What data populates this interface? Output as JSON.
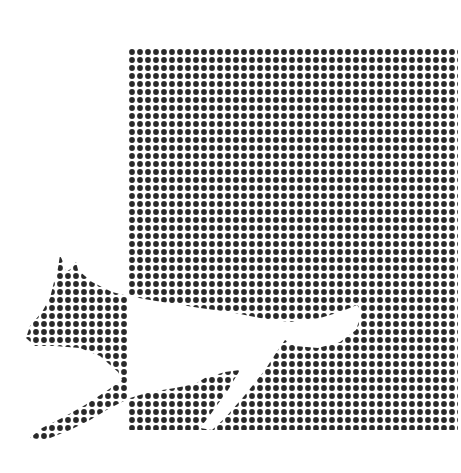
{
  "image": {
    "description": "Halftone illustration: a square field of black dots with a leaping cat silhouette crossing its lower-left edge; the cat appears white (negative) inside the square and dotted outside it",
    "colors": {
      "background": "#ffffff",
      "dot": "#2a2a2a"
    },
    "dot_pitch_px": 8,
    "dot_radius_px": 2.9,
    "square": {
      "x": 128,
      "y": 48,
      "width": 330,
      "height": 382
    }
  }
}
